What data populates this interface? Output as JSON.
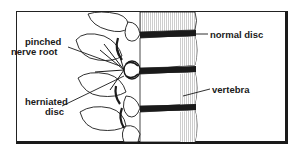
{
  "figure": {
    "labels": {
      "pinched_line1": "pinched",
      "pinched_line2": "nerve root",
      "herniated_line1": "herniated",
      "herniated_line2": "disc",
      "normal_disc": "normal disc",
      "vertebra": "vertebra"
    },
    "colors": {
      "ink": "#1a1a1a",
      "background": "#ffffff"
    }
  }
}
